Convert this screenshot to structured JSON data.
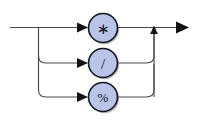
{
  "diagram": {
    "kind": "railroad-syntax-diagram",
    "canvas": {
      "width": 198,
      "height": 122,
      "background": "#ffffff"
    },
    "colors": {
      "line": "#4a4a4a",
      "arrow": "#111111",
      "node_fill": "#b9c5e8",
      "node_stroke": "#14161d",
      "node_shadow": "#7a7a7a",
      "label": "#11131a"
    },
    "entry": {
      "x": 10,
      "y": 27.5
    },
    "exit": {
      "x": 189,
      "y": 27.5
    },
    "fork_x": 38.5,
    "merge_x": 154,
    "nodes": [
      {
        "id": "node-star",
        "label": "∗",
        "label_class": "op-star",
        "semantic": "multiply-operator",
        "cx": 103,
        "cy": 28,
        "r": 14.5,
        "row_y": 27.5,
        "arrow_x": 88,
        "in_x": 60,
        "out_x": 117.5
      },
      {
        "id": "node-slash",
        "label": "/",
        "label_class": "op-slash",
        "semantic": "divide-operator",
        "cx": 103,
        "cy": 63,
        "r": 14.5,
        "row_y": 63,
        "arrow_x": 88,
        "in_x": 60,
        "out_x": 117.5
      },
      {
        "id": "node-percent",
        "label": "%",
        "label_class": "op-percent",
        "semantic": "modulo-operator",
        "cx": 103,
        "cy": 97,
        "r": 14.5,
        "row_y": 97,
        "arrow_x": 88,
        "in_x": 60,
        "out_x": 117.5
      }
    ],
    "paths": {
      "entry_line": "M 10,27.5 L 86,27.5",
      "branch_trunk": "M 38.5,27.5 L 38.5,90",
      "branch_to_slash": "M 38.5,56 Q 38.5,63 46,63 L 86,63",
      "branch_to_percent": "M 38.5,90 Q 38.5,97 46,97 L 86,97",
      "out_star": "M 117.5,27.5 L 188,27.5",
      "out_slash": "M 117.5,63 L 146,63 Q 154,63 154,56 L 154,30",
      "out_percent": "M 117.5,97 L 146,97 Q 154,97 154,90 L 154,63",
      "merge_up": "M 154,97 L 154,31"
    },
    "arrowheads": [
      {
        "id": "arrow-into-star",
        "direction": "right",
        "tip_x": 88,
        "tip_y": 27.5
      },
      {
        "id": "arrow-into-slash",
        "direction": "right",
        "tip_x": 88,
        "tip_y": 63
      },
      {
        "id": "arrow-into-percent",
        "direction": "right",
        "tip_x": 88,
        "tip_y": 97
      },
      {
        "id": "arrow-merge-up",
        "direction": "up",
        "tip_x": 154,
        "tip_y": 26
      },
      {
        "id": "arrow-exit",
        "direction": "right",
        "tip_x": 189,
        "tip_y": 27.5
      }
    ]
  }
}
